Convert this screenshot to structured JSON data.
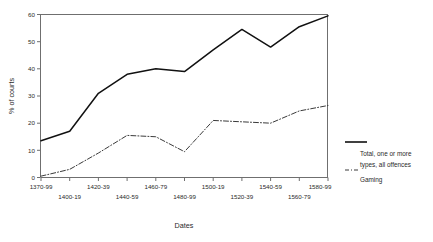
{
  "chart_data": {
    "type": "line",
    "title": "",
    "xlabel": "Dates",
    "ylabel": "% of courts",
    "ylim": [
      0,
      60
    ],
    "yticks": [
      0,
      10,
      20,
      30,
      40,
      50,
      60
    ],
    "grid": false,
    "legend_position": "right",
    "categories": [
      "1370-99",
      "1400-19",
      "1420-39",
      "1440-59",
      "1460-79",
      "1480-99",
      "1500-19",
      "1520-39",
      "1540-59",
      "1560-79",
      "1580-99"
    ],
    "series": [
      {
        "name": "Total, one or more types, all offences",
        "style": "solid",
        "color": "#111111",
        "values": [
          13.5,
          17,
          31,
          38,
          40,
          39,
          47,
          54.5,
          48,
          55.5,
          59.5
        ]
      },
      {
        "name": "Gaming",
        "style": "dash-dot",
        "color": "#3a3a3a",
        "values": [
          0.5,
          3,
          9,
          15.5,
          15,
          9.5,
          21,
          20.5,
          20,
          24.5,
          26.5
        ]
      }
    ]
  },
  "axes": {
    "y_title": "% of courts",
    "x_title": "Dates",
    "y_tick_labels": [
      "0",
      "10",
      "20",
      "30",
      "40",
      "50",
      "60"
    ],
    "x_tick_labels": [
      "1370-99",
      "1400-19",
      "1420-39",
      "1440-59",
      "1460-79",
      "1480-99",
      "1500-19",
      "1520-39",
      "1540-59",
      "1560-79",
      "1580-99"
    ]
  },
  "legend": {
    "entries": [
      {
        "label_line1": "Total, one or more",
        "label_line2": "types, all offences",
        "style": "solid"
      },
      {
        "label_line1": "Gaming",
        "label_line2": "",
        "style": "dash-dot"
      }
    ]
  }
}
